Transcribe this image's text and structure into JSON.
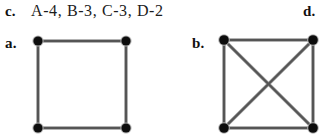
{
  "page": {
    "background_color": "#ffffff",
    "ink_color": "#1a1a1a",
    "width": 331,
    "height": 139
  },
  "options": {
    "c": {
      "label": "c.",
      "text": "A-4, B-3, C-3, D-2"
    },
    "d": {
      "label": "d."
    },
    "a": {
      "label": "a."
    },
    "b": {
      "label": "b."
    }
  },
  "figures": [
    {
      "id": "figure-a",
      "name": "square-graph-four-cycle",
      "option": "a.",
      "vertex_count": 4,
      "edge_count": 4,
      "edges": [
        "top",
        "right",
        "bottom",
        "left"
      ],
      "has_diagonals": false,
      "vertex_color": "#0d0d0d",
      "edge_color": "#555555"
    },
    {
      "id": "figure-b",
      "name": "complete-graph-k4",
      "option": "b.",
      "vertex_count": 4,
      "edge_count": 6,
      "edges": [
        "top",
        "right",
        "bottom",
        "left",
        "diagonal-tl-br",
        "diagonal-tr-bl"
      ],
      "has_diagonals": true,
      "vertex_color": "#0d0d0d",
      "edge_color": "#555555"
    }
  ]
}
